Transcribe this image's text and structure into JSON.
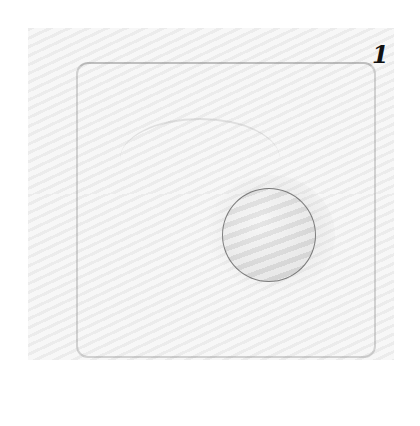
{
  "figure": {
    "label": "1"
  }
}
